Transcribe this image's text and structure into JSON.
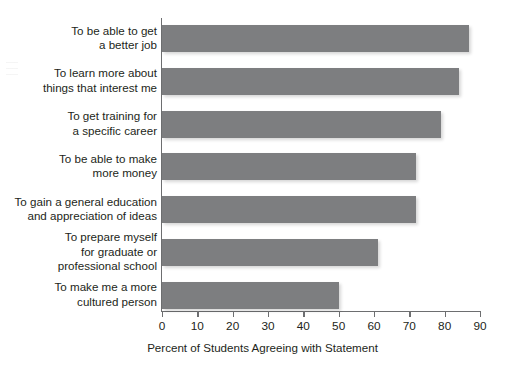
{
  "chart_data": {
    "type": "bar",
    "orientation": "horizontal",
    "title": "",
    "subtitle": "",
    "xlabel": "Percent of Students Agreeing with Statement",
    "ylabel": "",
    "xlim": [
      0,
      90
    ],
    "xticks": [
      0,
      10,
      20,
      30,
      40,
      50,
      60,
      70,
      80,
      90
    ],
    "xtick_labels": [
      "0",
      "10",
      "20",
      "30",
      "40",
      "50",
      "60",
      "70",
      "80",
      "90"
    ],
    "grid": false,
    "legend": null,
    "bar_color": "#7d7e80",
    "axis_color": "#6d6e70",
    "text_color": "#231f20",
    "categories": [
      "To be able to get\na better job",
      "To learn more about\nthings that interest me",
      "To get training for\na specific career",
      "To be able to make\nmore money",
      "To gain a general education\nand appreciation of ideas",
      "To prepare myself\nfor graduate or\nprofessional school",
      "To make me a more\ncultured person"
    ],
    "values": [
      87,
      84,
      79,
      72,
      72,
      61,
      50
    ],
    "series": [
      {
        "name": "Percent of Students Agreeing with Statement",
        "values": [
          87,
          84,
          79,
          72,
          72,
          61,
          50
        ]
      }
    ]
  }
}
